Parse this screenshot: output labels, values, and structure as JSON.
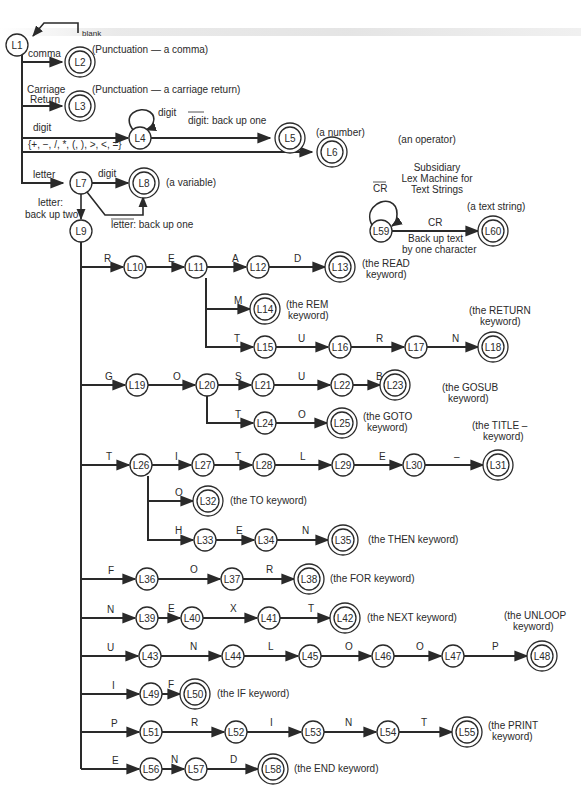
{
  "colors": {
    "ink": "#2a2a2a",
    "background": "#ffffff"
  },
  "states": {
    "L1": "L1",
    "L2": "L2",
    "L3": "L3",
    "L4": "L4",
    "L5": "L5",
    "L6": "L6",
    "L7": "L7",
    "L8": "L8",
    "L9": "L9",
    "L10": "L10",
    "L11": "L11",
    "L12": "L12",
    "L13": "L13",
    "L14": "L14",
    "L15": "L15",
    "L16": "L16",
    "L17": "L17",
    "L18": "L18",
    "L19": "L19",
    "L20": "L20",
    "L21": "L21",
    "L22": "L22",
    "L23": "L23",
    "L24": "L24",
    "L25": "L25",
    "L26": "L26",
    "L27": "L27",
    "L28": "L28",
    "L29": "L29",
    "L30": "L30",
    "L31": "L31",
    "L32": "L32",
    "L33": "L33",
    "L34": "L34",
    "L35": "L35",
    "L36": "L36",
    "L37": "L37",
    "L38": "L38",
    "L39": "L39",
    "L40": "L40",
    "L41": "L41",
    "L42": "L42",
    "L43": "L43",
    "L44": "L44",
    "L45": "L45",
    "L46": "L46",
    "L47": "L47",
    "L48": "L48",
    "L49": "L49",
    "L50": "L50",
    "L51": "L51",
    "L52": "L52",
    "L53": "L53",
    "L54": "L54",
    "L55": "L55",
    "L56": "L56",
    "L57": "L57",
    "L58": "L58",
    "L59": "L59",
    "L60": "L60"
  },
  "edges": {
    "blank": "blank",
    "comma": "comma",
    "carriage": "Carriage",
    "return": "Return",
    "digit": "digit",
    "digit_loop": "digit",
    "not_digit": "digit: back up one",
    "operators": "{+, −, /, *, (, ), >, <, =}",
    "letter": "letter",
    "l7_digit": "digit",
    "letter_back_1": "letter:",
    "letter_back_2": "back up two",
    "not_letter": "letter: back up one",
    "R": "R",
    "E1": "E",
    "A": "A",
    "D1": "D",
    "M": "M",
    "T1": "T",
    "U1": "U",
    "R2": "R",
    "N1": "N",
    "G": "G",
    "O1": "O",
    "S": "S",
    "U2": "U",
    "B": "B",
    "T2": "T",
    "O2": "O",
    "T3": "T",
    "I1": "I",
    "T4": "T",
    "L1e": "L",
    "E2": "E",
    "dash": "–",
    "O3": "O",
    "H": "H",
    "E3": "E",
    "N2": "N",
    "F1": "F",
    "O4": "O",
    "R3": "R",
    "N3": "N",
    "E4": "E",
    "X": "X",
    "T5": "T",
    "U3": "U",
    "N4": "N",
    "L2e": "L",
    "O5": "O",
    "O6": "O",
    "P1": "P",
    "I2": "I",
    "F2": "F",
    "P2": "P",
    "R4": "R",
    "I3": "I",
    "N5": "N",
    "T6": "T",
    "E5": "E",
    "N6": "N",
    "D2": "D",
    "not_CR": "CR",
    "CR": "CR",
    "backup_text_1": "Back up text",
    "backup_text_2": "by one character"
  },
  "notes": {
    "comma": "(Punctuation — a comma)",
    "cr": "(Punctuation — a carriage return)",
    "number": "(a number)",
    "operator": "(an operator)",
    "variable": "(a variable)",
    "subsidiary_1": "Subsidiary",
    "subsidiary_2": "Lex Machine for",
    "subsidiary_3": "Text Strings",
    "text_string": "(a text string)",
    "read_1": "(the READ",
    "read_2": "keyword)",
    "rem_1": "(the REM",
    "rem_2": "keyword)",
    "return_1": "(the RETURN",
    "return_2": "keyword)",
    "gosub_1": "(the GOSUB",
    "gosub_2": "keyword)",
    "goto_1": "(the GOTO",
    "goto_2": "keyword)",
    "title_1": "(the TITLE –",
    "title_2": "keyword)",
    "to": "(the TO keyword)",
    "then": "(the THEN keyword)",
    "for": "(the FOR keyword)",
    "next": "(the NEXT keyword)",
    "unloop_1": "(the UNLOOP",
    "unloop_2": "keyword)",
    "if": "(the IF keyword)",
    "print_1": "(the PRINT",
    "print_2": "keyword)",
    "end": "(the END keyword)"
  }
}
